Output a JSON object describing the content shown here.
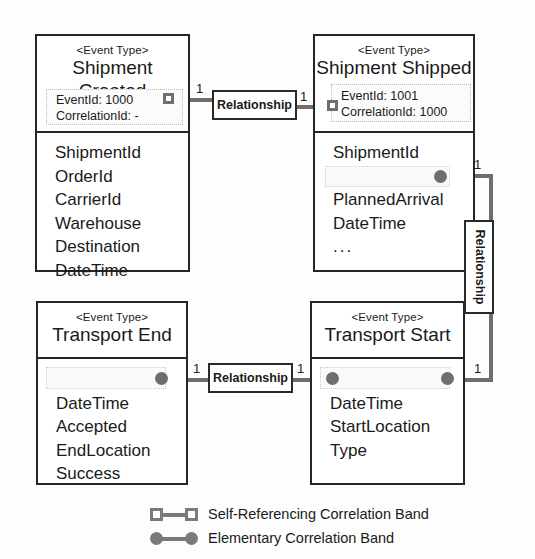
{
  "diagram": {
    "stereotype": "<Event Type>",
    "relationship_label": "Relationship",
    "multiplicity": "1",
    "colors": {
      "stroke": "#262626",
      "connector": "#6e6e6e",
      "band_border": "#bdbdbd",
      "background": "#ffffff"
    }
  },
  "boxes": {
    "shipment_created": {
      "stereotype": "<Event Type>",
      "name": "Shipment Created",
      "band": {
        "event_id": "EventId: 1000",
        "correlation_id": "CorrelationId: -"
      },
      "attributes": [
        "ShipmentId",
        "OrderId",
        "CarrierId",
        "Warehouse",
        "Destination",
        "DateTime"
      ]
    },
    "shipment_shipped": {
      "stereotype": "<Event Type>",
      "name": "Shipment Shipped",
      "band": {
        "event_id": "EventId: 1001",
        "correlation_id": "CorrelationId: 1000"
      },
      "attributes": [
        "ShipmentId",
        "TransportId",
        "PlannedArrival",
        "DateTime",
        "..."
      ]
    },
    "transport_end": {
      "stereotype": "<Event Type>",
      "name": "Transport End",
      "attributes": [
        "TransportId",
        "DateTime",
        "Accepted",
        "EndLocation",
        "Success"
      ]
    },
    "transport_start": {
      "stereotype": "<Event Type>",
      "name": "Transport Start",
      "attributes": [
        "TransportId",
        "DateTime",
        "StartLocation",
        "Type"
      ]
    }
  },
  "relationships": [
    {
      "id": "rel_top",
      "label": "Relationship",
      "left_multiplicity": "1",
      "right_multiplicity": "1",
      "from": "shipment_created",
      "to": "shipment_shipped",
      "band_type": "self-referencing",
      "orientation": "horizontal"
    },
    {
      "id": "rel_bottom",
      "label": "Relationship",
      "left_multiplicity": "1",
      "right_multiplicity": "1",
      "from": "transport_end",
      "to": "transport_start",
      "band_type": "elementary",
      "orientation": "horizontal"
    },
    {
      "id": "rel_right",
      "label": "Relationship",
      "left_multiplicity": "1",
      "right_multiplicity": "1",
      "from": "shipment_shipped",
      "to": "transport_start",
      "band_type": "elementary",
      "orientation": "vertical"
    }
  ],
  "legend": {
    "items": [
      {
        "symbol": "square",
        "label": "Self-Referencing Correlation Band"
      },
      {
        "symbol": "circle",
        "label": "Elementary Correlation Band"
      }
    ]
  }
}
